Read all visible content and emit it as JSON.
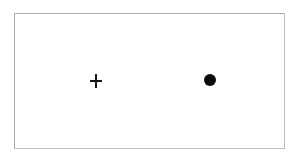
{
  "display": {
    "name": "stimulus-display",
    "background_color": "#ffffff",
    "width": 299,
    "height": 162
  },
  "frame": {
    "name": "stimulus-frame",
    "border_color": "#a9a9a9",
    "border_width_px": 1,
    "fill_color": "#ffffff",
    "left": 14,
    "top": 13,
    "width": 271,
    "height": 136
  },
  "markers": [
    {
      "name": "fixation-cross",
      "glyph": "+",
      "symbol_label": "plus-cross-icon",
      "color": "#161616",
      "center_x": 96,
      "center_y": 81,
      "width": 12,
      "height": 14,
      "stroke_width": 1.6
    },
    {
      "name": "target-dot",
      "glyph": "●",
      "symbol_label": "filled-circle-icon",
      "color": "#0a0a0a",
      "center_x": 210,
      "center_y": 80,
      "diameter": 12
    }
  ],
  "labels": {
    "fixation_alt": "+",
    "target_alt": "●"
  }
}
